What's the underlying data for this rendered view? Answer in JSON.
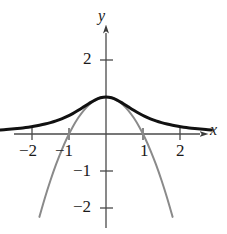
{
  "figure": {
    "kind": "mathematical-graph",
    "background": "#ffffff"
  },
  "axes": {
    "x_name": "x",
    "y_name": "y",
    "origin_px": {
      "x": 106,
      "y": 134
    },
    "units_per_px": 37,
    "x_ticks": [
      {
        "value": -2,
        "label": "−2"
      },
      {
        "value": -1,
        "label": "−1"
      },
      {
        "value": 1,
        "label": "1"
      },
      {
        "value": 2,
        "label": "2"
      }
    ],
    "y_ticks": [
      {
        "value": 2,
        "label": "2"
      },
      {
        "value": -1,
        "label": "−1"
      },
      {
        "value": -2,
        "label": "−2"
      }
    ],
    "axis_color": "#4a4a4a",
    "arrowheads": [
      "x-positive",
      "y-positive"
    ]
  },
  "chart_data": {
    "type": "line",
    "title": "",
    "xlabel": "x",
    "ylabel": "y",
    "xlim": [
      -2.85,
      2.9
    ],
    "ylim": [
      -2.7,
      2.6
    ],
    "grid": false,
    "legend": "none",
    "x": [
      -2.85,
      -2.7,
      -2.55,
      -2.4,
      -2.25,
      -2.1,
      -1.95,
      -1.8,
      -1.65,
      -1.5,
      -1.35,
      -1.2,
      -1.05,
      -0.9,
      -0.75,
      -0.6,
      -0.45,
      -0.3,
      -0.15,
      0,
      0.15,
      0.3,
      0.45,
      0.6,
      0.75,
      0.9,
      1.05,
      1.2,
      1.35,
      1.5,
      1.65,
      1.8,
      1.95,
      2.1,
      2.25,
      2.4,
      2.55,
      2.7,
      2.85
    ],
    "series": [
      {
        "name": "f",
        "expression": "1/(1+x^2)",
        "color": "#111111",
        "width_px": 3.0,
        "style": "solid",
        "values": [
          0.1096,
          0.1206,
          0.1333,
          0.1479,
          0.1649,
          0.1848,
          0.2083,
          0.2358,
          0.2686,
          0.3077,
          0.3544,
          0.4098,
          0.4756,
          0.5525,
          0.64,
          0.7353,
          0.8316,
          0.9174,
          0.978,
          1.0,
          0.978,
          0.9174,
          0.8316,
          0.7353,
          0.64,
          0.5525,
          0.4756,
          0.4098,
          0.3544,
          0.3077,
          0.2686,
          0.2358,
          0.2083,
          0.1848,
          0.1649,
          0.1479,
          0.1333,
          0.1206,
          0.1096
        ]
      },
      {
        "name": "P",
        "expression": "1 - x^2",
        "color": "#8a8a8a",
        "width_px": 2.0,
        "style": "solid",
        "values": [
          -7.1225,
          -6.29,
          -5.5025,
          -4.76,
          -4.0625,
          -3.41,
          -2.8025,
          -2.24,
          -1.7225,
          -1.25,
          -0.8225,
          -0.44,
          -0.1025,
          0.19,
          0.4375,
          0.64,
          0.7975,
          0.91,
          0.9775,
          1.0,
          0.9775,
          0.91,
          0.7975,
          0.64,
          0.4375,
          0.19,
          -0.1025,
          -0.44,
          -0.8225,
          -1.25,
          -1.7225,
          -2.24,
          -2.8025,
          -3.41,
          -4.0625,
          -4.76,
          -5.5025,
          -6.29,
          -7.1225
        ],
        "clip": {
          "ymin": -2.65
        }
      }
    ],
    "annotations": [
      {
        "text": "tangency at (0, 1)",
        "visible": false
      }
    ]
  }
}
